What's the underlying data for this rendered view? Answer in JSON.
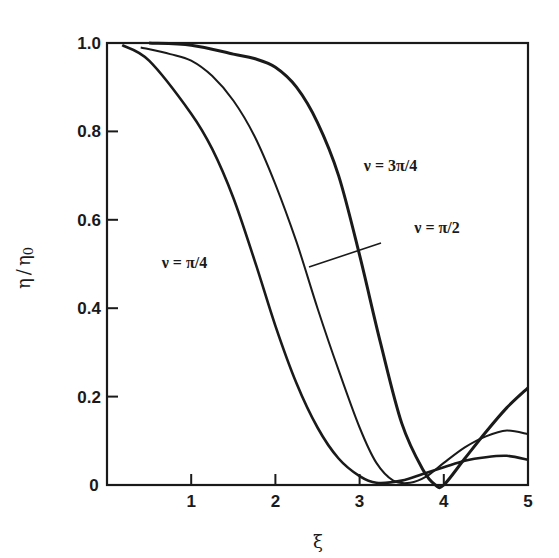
{
  "chart_data": {
    "type": "line",
    "title": "",
    "xlabel": "ξ",
    "ylabel": "η / η0",
    "xlim": [
      0,
      5
    ],
    "ylim": [
      0,
      1.0
    ],
    "grid": false,
    "legend": "inline labels",
    "x_ticks": [
      0,
      1,
      2,
      3,
      4,
      5
    ],
    "x_tick_labels": [
      "0",
      "1",
      "2",
      "3",
      "4",
      "5"
    ],
    "y_ticks": [
      0,
      0.2,
      0.4,
      0.6,
      0.8,
      1.0
    ],
    "y_tick_labels": [
      "0",
      "0.2",
      "0.4",
      "0.6",
      "0.8",
      "1.0"
    ],
    "series": [
      {
        "name": "ν = π/4",
        "x": [
          0.18,
          0.5,
          1.0,
          1.25,
          1.5,
          1.75,
          2.0,
          2.25,
          2.5,
          2.75,
          3.0,
          3.2,
          3.5,
          3.75,
          4.0,
          4.25,
          4.5,
          4.75,
          5.0
        ],
        "values": [
          0.995,
          0.96,
          0.84,
          0.76,
          0.65,
          0.51,
          0.36,
          0.23,
          0.13,
          0.06,
          0.02,
          0.005,
          0.01,
          0.025,
          0.04,
          0.055,
          0.063,
          0.066,
          0.057
        ]
      },
      {
        "name": "ν = π/2",
        "x": [
          0.4,
          0.75,
          1.0,
          1.25,
          1.5,
          1.75,
          2.0,
          2.25,
          2.5,
          2.75,
          3.0,
          3.2,
          3.4,
          3.6,
          3.8,
          4.0,
          4.25,
          4.5,
          4.75,
          5.0
        ],
        "values": [
          0.99,
          0.975,
          0.96,
          0.925,
          0.87,
          0.79,
          0.68,
          0.55,
          0.4,
          0.26,
          0.13,
          0.05,
          0.01,
          0.005,
          0.02,
          0.05,
          0.085,
          0.11,
          0.123,
          0.115
        ]
      },
      {
        "name": "ν = 3π/4",
        "x": [
          0.5,
          1.0,
          1.5,
          1.75,
          2.0,
          2.25,
          2.5,
          2.75,
          3.0,
          3.25,
          3.5,
          3.75,
          3.9,
          4.0,
          4.25,
          4.5,
          4.75,
          5.0
        ],
        "values": [
          1.0,
          0.995,
          0.975,
          0.965,
          0.945,
          0.9,
          0.82,
          0.7,
          0.52,
          0.32,
          0.14,
          0.035,
          0.0,
          0.0,
          0.06,
          0.12,
          0.175,
          0.22
        ]
      }
    ],
    "annotations": [
      {
        "text": "ν = 3π/4",
        "x": 3.05,
        "y": 0.71
      },
      {
        "text": "ν = π/2",
        "x": 3.65,
        "y": 0.57
      },
      {
        "text": "ν = π/4",
        "x": 0.65,
        "y": 0.49
      }
    ]
  },
  "labels": {
    "ylabel_eta": "η",
    "ylabel_slash": "/",
    "ylabel_eta0": "η",
    "ylabel_sub": "0",
    "xlabel": "ξ"
  }
}
